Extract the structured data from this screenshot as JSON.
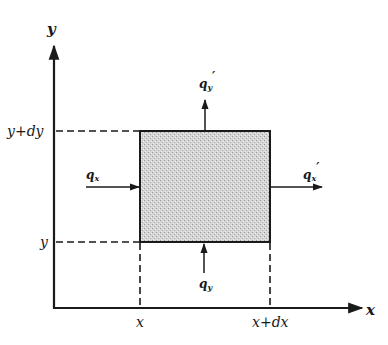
{
  "diagram": {
    "type": "control-volume heat flux element",
    "axes": {
      "x_label": "x",
      "y_label": "y"
    },
    "ticks": {
      "x_left": "x",
      "x_right": "x+dx",
      "y_bottom": "y",
      "y_top": "y+dy"
    },
    "fluxes": {
      "q_x_in": "q",
      "q_x_in_sub": "x",
      "q_x_out": "q",
      "q_x_out_sub": "x",
      "q_x_out_prime": "′",
      "q_y_in": "q",
      "q_y_in_sub": "y",
      "q_y_out": "q",
      "q_y_out_sub": "y",
      "q_y_out_prime": "′"
    },
    "colors": {
      "ink": "#1a1a1a",
      "element_fill": "#c8c8c8"
    }
  }
}
